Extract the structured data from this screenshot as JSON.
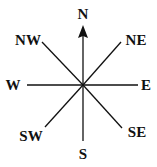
{
  "diagram": {
    "type": "compass-rose",
    "line_color": "#111111",
    "label_color": "#111111",
    "directions": [
      {
        "key": "N",
        "label": "N",
        "has_arrow": true
      },
      {
        "key": "NE",
        "label": "NE"
      },
      {
        "key": "E",
        "label": "E"
      },
      {
        "key": "SE",
        "label": "SE"
      },
      {
        "key": "S",
        "label": "S"
      },
      {
        "key": "SW",
        "label": "SW"
      },
      {
        "key": "W",
        "label": "W"
      },
      {
        "key": "NW",
        "label": "NW"
      }
    ]
  }
}
